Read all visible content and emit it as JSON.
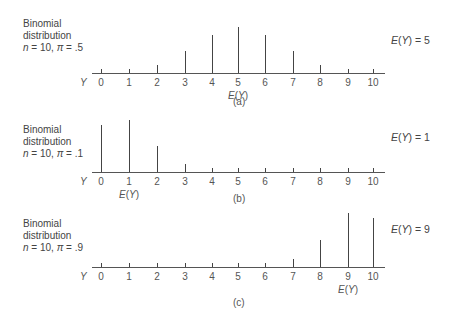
{
  "chart_data": [
    {
      "type": "bar",
      "title": "Binomial distribution n = 10, π = .5",
      "label_lines": [
        "Binomial",
        "distribution",
        "n = 10, π = .5"
      ],
      "caption": "(a)",
      "xlabel": "Y",
      "categories": [
        0,
        1,
        2,
        3,
        4,
        5,
        6,
        7,
        8,
        9,
        10
      ],
      "values": [
        0.001,
        0.01,
        0.044,
        0.117,
        0.205,
        0.246,
        0.205,
        0.117,
        0.044,
        0.01,
        0.001
      ],
      "expected_value": 5,
      "expected_label": "E(Y) = 5",
      "ev_marker": "E(Y)"
    },
    {
      "type": "bar",
      "title": "Binomial distribution n = 10, π = .1",
      "label_lines": [
        "Binomial",
        "distribution",
        "n = 10, π = .1"
      ],
      "caption": "(b)",
      "xlabel": "Y",
      "categories": [
        0,
        1,
        2,
        3,
        4,
        5,
        6,
        7,
        8,
        9,
        10
      ],
      "values": [
        0.349,
        0.387,
        0.194,
        0.057,
        0.011,
        0.001,
        0.0,
        0.0,
        0.0,
        0.0,
        0.0
      ],
      "expected_value": 1,
      "expected_label": "E(Y) = 1",
      "ev_marker": "E(Y)"
    },
    {
      "type": "bar",
      "title": "Binomial distribution n = 10, π = .9",
      "label_lines": [
        "Binomial",
        "distribution",
        "n = 10, π = .9"
      ],
      "caption": "(c)",
      "xlabel": "Y",
      "categories": [
        0,
        1,
        2,
        3,
        4,
        5,
        6,
        7,
        8,
        9,
        10
      ],
      "values": [
        0.0,
        0.0,
        0.0,
        0.0,
        0.0,
        0.001,
        0.011,
        0.057,
        0.194,
        0.387,
        0.349
      ],
      "expected_value": 9,
      "expected_label": "E(Y) = 9",
      "ev_marker": "E(Y)"
    }
  ],
  "layout": {
    "tick_x": [
      101,
      129,
      157,
      185,
      212,
      238,
      265,
      293,
      320,
      348,
      373
    ],
    "axis_x0": 92,
    "axis_x1": 385,
    "panels": [
      {
        "axis_y": 73,
        "label_top": 18,
        "ev_top": 34,
        "cap_top": 96,
        "cap_x": 233,
        "px_per_unit": 187
      },
      {
        "axis_y": 172,
        "label_top": 124,
        "ev_top": 131,
        "cap_top": 193,
        "cap_x": 233,
        "px_per_unit": 134
      },
      {
        "axis_y": 267,
        "label_top": 218,
        "ev_top": 223,
        "cap_top": 297,
        "cap_x": 233,
        "px_per_unit": 140
      }
    ]
  }
}
